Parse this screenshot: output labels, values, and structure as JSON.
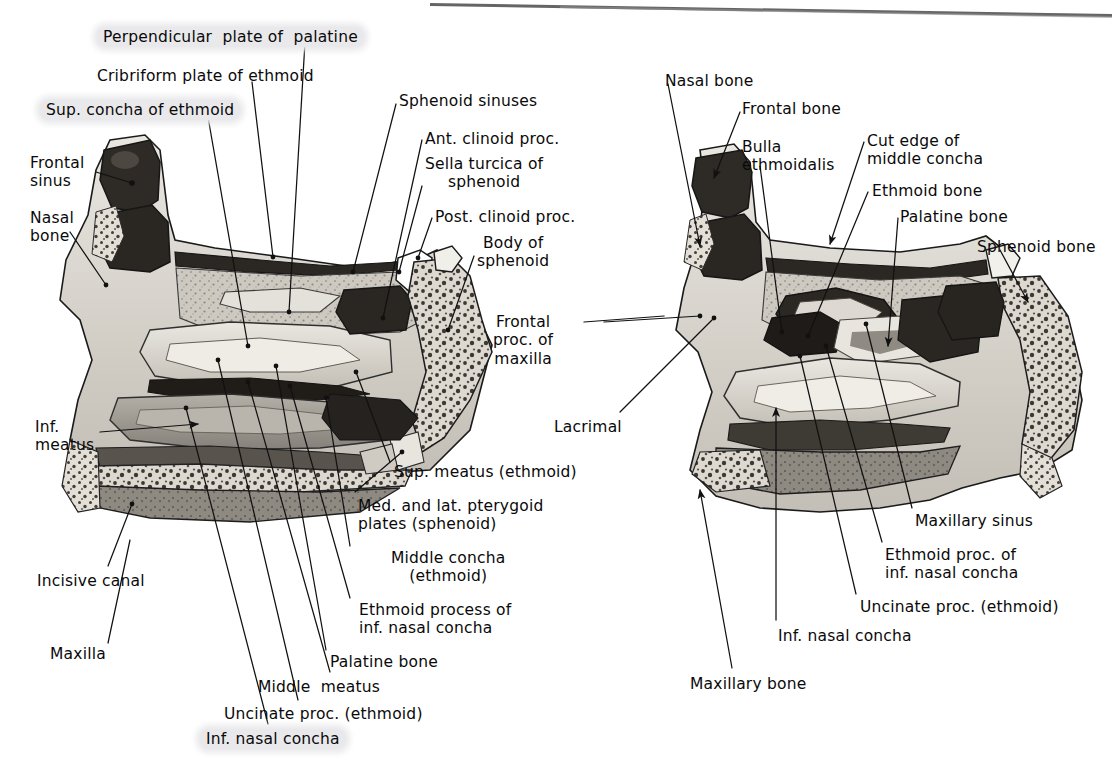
{
  "figure": {
    "panels": [
      {
        "id": "left-panel",
        "name": "Lateral nasal wall with conchae in place"
      },
      {
        "id": "right-panel",
        "name": "Lateral nasal wall with middle concha cut away"
      }
    ]
  },
  "colors": {
    "ink": "#0a0a0a",
    "paper": "#ffffff",
    "highlight": "#e9e9ec",
    "bone_light": "#d7d4cd",
    "bone_mid": "#a8a49a",
    "bone_dark": "#6e6a62",
    "cavity": "#3a3732",
    "cavity_deep": "#241f1b",
    "outline": "#1a1a1a"
  },
  "left_panel_labels": [
    {
      "key": "perpendicular_plate",
      "text": "Perpendicular  plate of  palatine",
      "x": 97,
      "y": 27,
      "align": "left"
    },
    {
      "key": "cribriform_plate",
      "text": "Cribriform plate of ethmoid",
      "x": 97,
      "y": 67,
      "align": "left"
    },
    {
      "key": "sup_concha_ethmoid",
      "text": "Sup. concha of ethmoid",
      "x": 40,
      "y": 100,
      "align": "left",
      "highlight": true
    },
    {
      "key": "frontal_sinus",
      "text": "Frontal\nsinus",
      "x": 30,
      "y": 154,
      "align": "left"
    },
    {
      "key": "nasal_bone_left",
      "text": "Nasal\nbone",
      "x": 30,
      "y": 209,
      "align": "left"
    },
    {
      "key": "sphenoid_sinuses",
      "text": "Sphenoid sinuses",
      "x": 399,
      "y": 92,
      "align": "left"
    },
    {
      "key": "ant_clinoid_proc",
      "text": "Ant. clinoid proc.",
      "x": 425,
      "y": 130,
      "align": "left"
    },
    {
      "key": "sella_turcica",
      "text": "Sella turcica of\nsphenoid",
      "x": 425,
      "y": 155,
      "align": "left"
    },
    {
      "key": "post_clinoid_proc",
      "text": "Post. clinoid proc.",
      "x": 435,
      "y": 208,
      "align": "left"
    },
    {
      "key": "body_of_sphenoid",
      "text": "Body of\nsphenoid",
      "x": 477,
      "y": 234,
      "align": "left"
    },
    {
      "key": "frontal_proc_maxilla",
      "text": "Frontal\nproc. of\nmaxilla",
      "x": 493,
      "y": 313,
      "align": "left"
    },
    {
      "key": "inf_meatus",
      "text": "Inf.\nmeatus",
      "x": 35,
      "y": 418,
      "align": "left"
    },
    {
      "key": "incisive_canal",
      "text": "Incisive canal",
      "x": 37,
      "y": 572,
      "align": "left"
    },
    {
      "key": "maxilla",
      "text": "Maxilla",
      "x": 50,
      "y": 645,
      "align": "left"
    },
    {
      "key": "sup_meatus_ethmoid",
      "text": "Sup. meatus (ethmoid)",
      "x": 394,
      "y": 463,
      "align": "left"
    },
    {
      "key": "pterygoid_plates",
      "text": "Med. and lat. pterygoid\nplates (sphenoid)",
      "x": 358,
      "y": 497,
      "align": "left"
    },
    {
      "key": "middle_concha_ethmoid",
      "text": "Middle concha\n(ethmoid)",
      "x": 391,
      "y": 549,
      "align": "left"
    },
    {
      "key": "ethmoid_proc_inf_left",
      "text": "Ethmoid process of\ninf. nasal concha",
      "x": 359,
      "y": 601,
      "align": "left"
    },
    {
      "key": "palatine_bone_left",
      "text": "Palatine bone",
      "x": 330,
      "y": 653,
      "align": "left"
    },
    {
      "key": "middle_meatus",
      "text": "Middle  meatus",
      "x": 258,
      "y": 678,
      "align": "left"
    },
    {
      "key": "uncinate_proc_left",
      "text": "Uncinate proc. (ethmoid)",
      "x": 224,
      "y": 705,
      "align": "left"
    },
    {
      "key": "inf_nasal_concha_left",
      "text": "Inf. nasal concha",
      "x": 200,
      "y": 729,
      "align": "left",
      "highlight": true
    }
  ],
  "right_panel_labels": [
    {
      "key": "nasal_bone_right",
      "text": "Nasal bone",
      "x": 665,
      "y": 72,
      "align": "left"
    },
    {
      "key": "frontal_bone",
      "text": "Frontal bone",
      "x": 742,
      "y": 100,
      "align": "left"
    },
    {
      "key": "bulla_ethmoidalis",
      "text": "Bulla\nethmoidalis",
      "x": 742,
      "y": 138,
      "align": "left"
    },
    {
      "key": "cut_edge_middle_concha",
      "text": "Cut edge of\nmiddle concha",
      "x": 867,
      "y": 132,
      "align": "left"
    },
    {
      "key": "ethmoid_bone",
      "text": "Ethmoid bone",
      "x": 872,
      "y": 182,
      "align": "left"
    },
    {
      "key": "palatine_bone_right",
      "text": "Palatine bone",
      "x": 900,
      "y": 208,
      "align": "left"
    },
    {
      "key": "sphenoid_bone",
      "text": "Sphenoid bone",
      "x": 977,
      "y": 238,
      "align": "left"
    },
    {
      "key": "lacrimal",
      "text": "Lacrimal",
      "x": 554,
      "y": 418,
      "align": "left"
    },
    {
      "key": "maxillary_sinus",
      "text": "Maxillary sinus",
      "x": 915,
      "y": 512,
      "align": "left"
    },
    {
      "key": "ethmoid_proc_inf_right",
      "text": "Ethmoid proc. of\ninf. nasal concha",
      "x": 885,
      "y": 546,
      "align": "left"
    },
    {
      "key": "uncinate_proc_right",
      "text": "Uncinate proc. (ethmoid)",
      "x": 860,
      "y": 598,
      "align": "left"
    },
    {
      "key": "inf_nasal_concha_right",
      "text": "Inf. nasal concha",
      "x": 778,
      "y": 627,
      "align": "left"
    },
    {
      "key": "maxillary_bone",
      "text": "Maxillary bone",
      "x": 690,
      "y": 675,
      "align": "left"
    }
  ],
  "artifacts": {
    "scan_edge": "thin dark diagonal scan line across the top margin"
  }
}
